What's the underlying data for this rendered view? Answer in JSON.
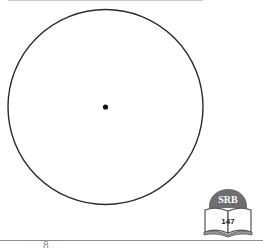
{
  "figure": {
    "type": "circle-with-center",
    "circle": {
      "cx": 105.5,
      "cy": 107,
      "r": 97.5,
      "stroke": "#2a2a2a",
      "stroke_width": 1.4
    },
    "center_point": {
      "cx": 105.5,
      "cy": 107,
      "r": 2.6,
      "fill": "#111111"
    }
  },
  "badge": {
    "title": "SRB",
    "page_ref": "147",
    "dome_color": "#6e6e6e",
    "book_color": "#9a9a9a"
  },
  "footer": {
    "fragment_text": "8"
  },
  "colors": {
    "top_rule": "#c8c8c8",
    "bottom_rule": "#8c8c8c"
  }
}
